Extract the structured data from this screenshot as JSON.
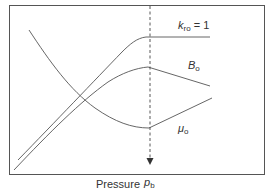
{
  "diagram": {
    "type": "line-sketch",
    "x_axis_label": "Pressure",
    "marker": {
      "label_main": "p",
      "label_sub": "b",
      "description": "bubble point pressure (dashed vertical line, arrow pointing down)"
    },
    "curves": [
      {
        "id": "kro",
        "label_main": "k",
        "label_sub": "ro",
        "label_suffix": " = 1",
        "shape": "rises to plateau at bubble point then flat"
      },
      {
        "id": "bo",
        "label_main": "B",
        "label_sub": "o",
        "label_suffix": "",
        "shape": "rises to peak at bubble point then declines"
      },
      {
        "id": "muo",
        "label_main": "μ",
        "label_sub": "o",
        "label_suffix": "",
        "shape": "falls to minimum at bubble point then rises"
      }
    ],
    "colors": {
      "line": "#555555",
      "frame": "#555555",
      "text": "#333333",
      "background": "#ffffff"
    }
  }
}
